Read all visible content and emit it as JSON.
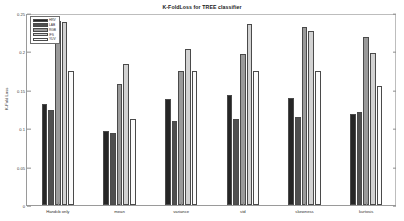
{
  "chart_data": {
    "type": "bar",
    "title": "K-FoldLoss for TREE classifier",
    "xlabel": "",
    "ylabel": "K-Fold Loss",
    "ylim": [
      0,
      0.25
    ],
    "yticks": [
      0,
      0.05,
      0.1,
      0.15,
      0.2,
      0.25
    ],
    "ytick_labels": [
      "0",
      "0.05",
      "0.1",
      "0.15",
      "0.2",
      "0.25"
    ],
    "grid": false,
    "legend_position": "upper-left",
    "categories": [
      "Handcb only",
      "mean",
      "variance",
      "std",
      "skewness",
      "kurtosis"
    ],
    "series": [
      {
        "name": "HRV",
        "color": "#262626",
        "values": [
          0.132,
          0.096,
          0.138,
          0.143,
          0.139,
          0.118
        ]
      },
      {
        "name": "LAB",
        "color": "#4f4f4f",
        "values": [
          0.124,
          0.094,
          0.109,
          0.112,
          0.114,
          0.121
        ]
      },
      {
        "name": "RGB",
        "color": "#9a9a9a",
        "values": [
          0.24,
          0.158,
          0.175,
          0.196,
          0.232,
          0.219
        ]
      },
      {
        "name": "IFS",
        "color": "#d2d2d2",
        "values": [
          0.238,
          0.184,
          0.203,
          0.236,
          0.226,
          0.198
        ]
      },
      {
        "name": "YUV",
        "color": "#fbfbfb",
        "values": [
          0.175,
          0.112,
          0.175,
          0.175,
          0.175,
          0.155
        ]
      }
    ]
  },
  "legend": {
    "entries": [
      {
        "label": "HRV"
      },
      {
        "label": "LAB"
      },
      {
        "label": "RGB"
      },
      {
        "label": "IFS"
      },
      {
        "label": "YUV"
      }
    ]
  }
}
